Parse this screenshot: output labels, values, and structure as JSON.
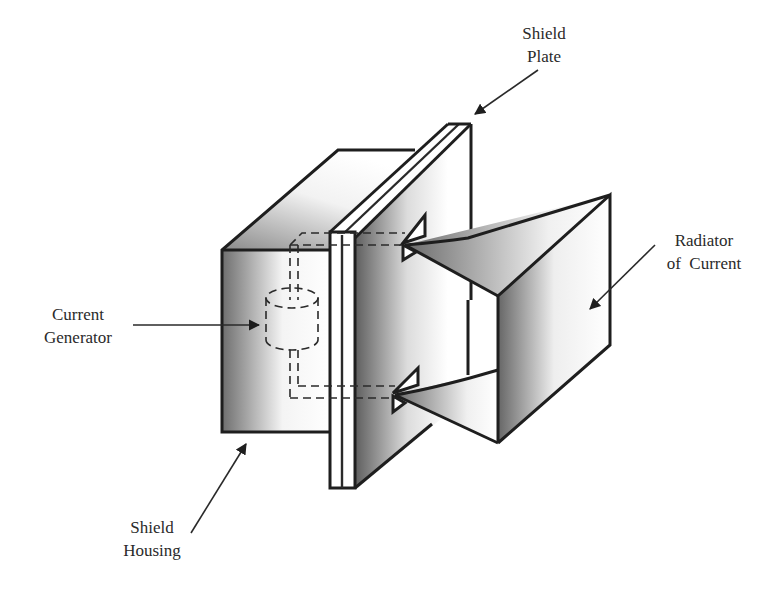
{
  "diagram": {
    "labels": {
      "shield_plate": [
        "Shield",
        "Plate"
      ],
      "radiator": [
        "Radiator",
        "of  Current"
      ],
      "current_generator": [
        "Current",
        "Generator"
      ],
      "shield_housing": [
        "Shield",
        "Housing"
      ]
    },
    "components": [
      {
        "id": "shield-housing",
        "name": "Shield Housing"
      },
      {
        "id": "shield-plate",
        "name": "Shield Plate"
      },
      {
        "id": "current-generator",
        "name": "Current Generator"
      },
      {
        "id": "radiator",
        "name": "Radiator of Current"
      }
    ],
    "colors": {
      "line": "#1e1e1e",
      "shade_dark": "#7a7a7a",
      "shade_light": "#ffffff",
      "text": "#2a2a2a"
    }
  }
}
